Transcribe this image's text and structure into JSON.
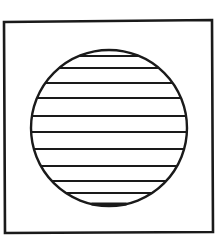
{
  "figure": {
    "stroke_color": "#1a1a1a",
    "background_color": "#ffffff",
    "square": {
      "x1": 4,
      "y1": 21,
      "x2": 212,
      "y2": 232
    },
    "circle": {
      "cx": 109,
      "cy": 128,
      "r": 78
    },
    "hatch_lines_y": [
      56,
      68,
      83,
      98,
      116,
      132,
      149,
      166,
      181,
      193,
      204
    ]
  }
}
